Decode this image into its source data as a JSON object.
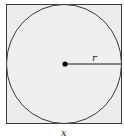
{
  "diagram": {
    "labels": {
      "radius": "r",
      "side": "x"
    },
    "colors": {
      "fill": "#ebebeb",
      "stroke": "#3a3a3a",
      "dot": "#000000"
    }
  }
}
